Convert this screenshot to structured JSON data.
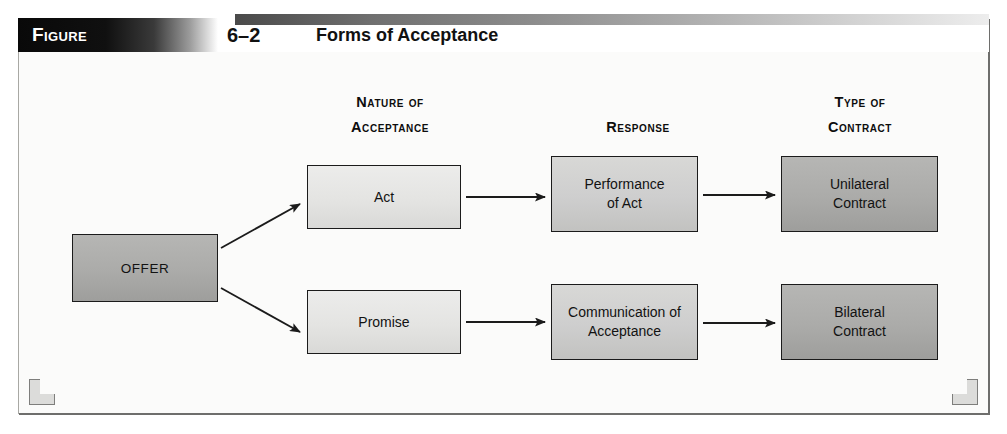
{
  "figure": {
    "tab_label": "Figure",
    "number": "6–2",
    "title": "Forms of Acceptance"
  },
  "column_headers": [
    {
      "id": "nature-of-acceptance",
      "line1": "Nature of",
      "line2": "Acceptance"
    },
    {
      "id": "response",
      "line1": "Response",
      "line2": ""
    },
    {
      "id": "type-of-contract",
      "line1": "Type of",
      "line2": "Contract"
    }
  ],
  "nodes": {
    "offer": {
      "label": "OFFER",
      "tone": "dark"
    },
    "act": {
      "label": "Act",
      "tone": "light"
    },
    "promise": {
      "label": "Promise",
      "tone": "light"
    },
    "performance": {
      "line1": "Performance",
      "line2": "of Act",
      "tone": "mid"
    },
    "communication": {
      "line1": "Communication of",
      "line2": "Acceptance",
      "tone": "mid"
    },
    "unilateral": {
      "line1": "Unilateral",
      "line2": "Contract",
      "tone": "dark"
    },
    "bilateral": {
      "line1": "Bilateral",
      "line2": "Contract",
      "tone": "dark"
    }
  },
  "colors": {
    "frame_border": "#a8a8a4",
    "page_background": "#ffffff",
    "canvas_background": "#fbfbfa",
    "node_border": "#1b1b1b",
    "node_shadow": "#111111",
    "arrow": "#1b1b1b",
    "tab_gradient_start": "#090909",
    "tab_gradient_end": "#ffffff",
    "tone_light": "#e7e7e5",
    "tone_mid": "#cecece",
    "tone_dark": "#ababa9",
    "corner_ornament": "#dcdcda"
  },
  "flow": {
    "edges": [
      {
        "from": "offer",
        "to": "act",
        "style": "diagonal-up"
      },
      {
        "from": "offer",
        "to": "promise",
        "style": "diagonal-down"
      },
      {
        "from": "act",
        "to": "performance",
        "style": "horizontal"
      },
      {
        "from": "performance",
        "to": "unilateral",
        "style": "horizontal"
      },
      {
        "from": "promise",
        "to": "communication",
        "style": "horizontal"
      },
      {
        "from": "communication",
        "to": "bilateral",
        "style": "horizontal"
      }
    ]
  }
}
